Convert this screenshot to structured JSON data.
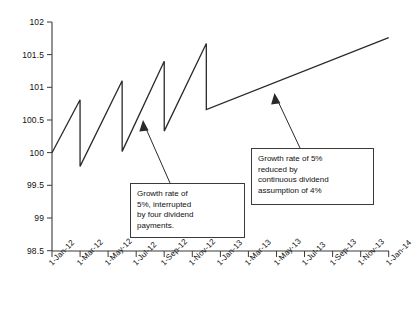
{
  "chart_data": {
    "type": "line",
    "title": "",
    "xlabel": "",
    "ylabel": "",
    "ylim": [
      98.5,
      102
    ],
    "yticks": [
      "98.5",
      "99",
      "99.5",
      "100",
      "100.5",
      "101",
      "101.5",
      "102"
    ],
    "ytick_values": [
      98.5,
      99,
      99.5,
      100,
      100.5,
      101,
      101.5,
      102
    ],
    "xticks": [
      "1-Jan-12",
      "1-Mar-12",
      "1-May-12",
      "1-Jul-12",
      "1-Sep-12",
      "1-Nov-12",
      "1-Jan-13",
      "1-Mar-13",
      "1-May-13",
      "1-Jul-13",
      "1-Sep-13",
      "1-Nov-13",
      "1-Jan-14"
    ],
    "xlim": [
      "1-Jan-12",
      "1-Jan-14"
    ],
    "grid": false,
    "legend": false,
    "series": [
      {
        "name": "Forward price with discrete dividends",
        "points": [
          {
            "x": "1-Jan-12",
            "y": 100.0
          },
          {
            "x": "1-Mar-12",
            "y": 100.81
          },
          {
            "x": "1-Mar-12",
            "y": 99.79
          },
          {
            "x": "1-Jun-12",
            "y": 101.1
          },
          {
            "x": "1-Jun-12",
            "y": 100.02
          },
          {
            "x": "1-Sep-12",
            "y": 101.4
          },
          {
            "x": "1-Sep-12",
            "y": 100.33
          },
          {
            "x": "1-Dec-12",
            "y": 101.67
          },
          {
            "x": "1-Dec-12",
            "y": 100.66
          },
          {
            "x": "1-Jan-14",
            "y": 101.76
          }
        ]
      }
    ],
    "annotations": [
      {
        "id": "discrete-dividend-note",
        "lines": [
          "Growth rate of",
          "5%, interrupted",
          "by four dividend",
          "payments."
        ],
        "points_to": {
          "x": "1-Sep-12",
          "y": 100.45
        }
      },
      {
        "id": "continuous-dividend-note",
        "lines": [
          "Growth rate of 5%",
          "reduced by",
          "continuous dividend",
          "assumption of 4%"
        ],
        "points_to": {
          "x": "1-Apr-13",
          "y": 101.12
        }
      }
    ]
  }
}
